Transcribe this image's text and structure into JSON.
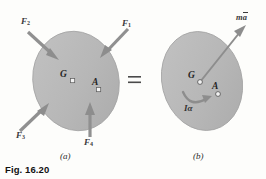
{
  "figure": {
    "caption": "Fig. 16.20",
    "panels": [
      {
        "id": "a",
        "label": "(a)"
      },
      {
        "id": "b",
        "label": "(b)"
      }
    ],
    "equals_sign": "=",
    "panel_a": {
      "body_label": "rigid-body-ellipse",
      "points": [
        {
          "name": "G",
          "label": "G"
        },
        {
          "name": "A",
          "label": "A"
        }
      ],
      "forces": [
        {
          "name": "F1",
          "label": "F",
          "sub": "1"
        },
        {
          "name": "F2",
          "label": "F",
          "sub": "2"
        },
        {
          "name": "F3",
          "label": "F",
          "sub": "3"
        },
        {
          "name": "F4",
          "label": "F",
          "sub": "4"
        }
      ]
    },
    "panel_b": {
      "body_label": "rigid-body-ellipse",
      "points": [
        {
          "name": "G",
          "label": "G"
        },
        {
          "name": "A",
          "label": "A"
        }
      ],
      "effective_force": {
        "m": "m",
        "a": "a"
      },
      "moment": {
        "I": "I",
        "alpha": "α"
      }
    }
  },
  "colors": {
    "body_fill": "#b9b9b9",
    "body_stroke": "#9a9a9a",
    "arrow": "#8f8f8f",
    "text": "#2b2b2b",
    "page_bg": "#fdfdfb"
  }
}
